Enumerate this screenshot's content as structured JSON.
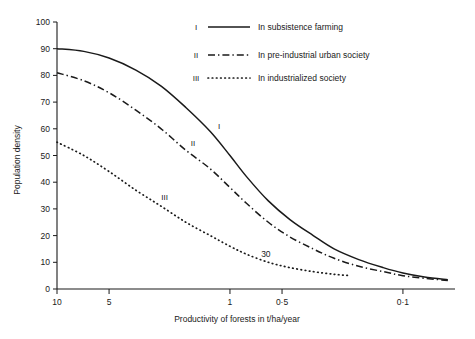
{
  "chart_data": {
    "type": "line",
    "title": "",
    "xlabel": "Productivity of forests in t/ha/year",
    "ylabel": "Population density",
    "x_scale": "log-reversed",
    "x_ticks": [
      "10",
      "5",
      "1",
      "0·5",
      "0·1"
    ],
    "x_tick_values": [
      10,
      5,
      1,
      0.5,
      0.1
    ],
    "xlim": [
      10,
      0.05
    ],
    "y_ticks": [
      "0",
      "10",
      "20",
      "30",
      "40",
      "50",
      "60",
      "70",
      "80",
      "90",
      "100"
    ],
    "y_tick_values": [
      0,
      10,
      20,
      30,
      40,
      50,
      60,
      70,
      80,
      90,
      100
    ],
    "ylim": [
      0,
      100
    ],
    "grid": false,
    "legend_position": "top-right",
    "annotations": [
      {
        "text": "30",
        "x": 0.62,
        "y": 12
      }
    ],
    "series": [
      {
        "name": "I",
        "label": "In subsistence farming",
        "style": "solid",
        "color": "#1a1a1a",
        "inline_label": "I",
        "x": [
          10,
          7,
          5,
          3.5,
          2.5,
          1.8,
          1.3,
          1.0,
          0.8,
          0.6,
          0.45,
          0.33,
          0.25,
          0.18,
          0.13,
          0.1,
          0.075,
          0.055
        ],
        "y": [
          90,
          89,
          86.5,
          82,
          76,
          68,
          59,
          50,
          42,
          33,
          26,
          20,
          15,
          11,
          8,
          6,
          4.5,
          3.5
        ]
      },
      {
        "name": "II",
        "label": "In pre-industrial urban society",
        "style": "dash-dot",
        "color": "#1a1a1a",
        "inline_label": "II",
        "x": [
          10,
          7,
          5,
          3.5,
          2.5,
          1.8,
          1.3,
          1.0,
          0.8,
          0.6,
          0.45,
          0.33,
          0.25,
          0.18,
          0.13,
          0.1,
          0.075,
          0.055
        ],
        "y": [
          81,
          78,
          73.5,
          67,
          60,
          52,
          45,
          38,
          32,
          25,
          19.5,
          15,
          11.5,
          8.5,
          6.5,
          5,
          4,
          3.2
        ]
      },
      {
        "name": "III",
        "label": "In industrialized society",
        "style": "dotted",
        "color": "#1a1a1a",
        "inline_label": "III",
        "x": [
          10,
          7,
          5,
          3.5,
          2.5,
          1.8,
          1.3,
          1.0,
          0.8,
          0.6,
          0.45,
          0.33,
          0.25,
          0.2
        ],
        "y": [
          55,
          50,
          44,
          37,
          31,
          25,
          20,
          16,
          13,
          10,
          8,
          6.5,
          5.5,
          5
        ]
      }
    ]
  },
  "legend": {
    "items": [
      {
        "key": "I",
        "label": "In subsistence farming"
      },
      {
        "key": "II",
        "label": "In pre-industrial urban society"
      },
      {
        "key": "III",
        "label": "In industrialized society"
      }
    ]
  }
}
